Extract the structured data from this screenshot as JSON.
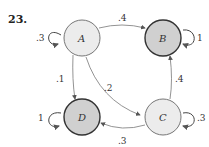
{
  "problem_number": "23.",
  "colors": {
    "light_node": "#ececec",
    "dark_node": "#cfcfcf",
    "light_stroke": "#888888",
    "dark_stroke": "#333333",
    "edge": "#666666"
  },
  "nodes": [
    {
      "id": "A",
      "label": "A",
      "absorbing": false
    },
    {
      "id": "B",
      "label": "B",
      "absorbing": true
    },
    {
      "id": "C",
      "label": "C",
      "absorbing": false
    },
    {
      "id": "D",
      "label": "D",
      "absorbing": true
    }
  ],
  "edges": [
    {
      "from": "A",
      "to": "A",
      "label": ".3"
    },
    {
      "from": "A",
      "to": "B",
      "label": ".4"
    },
    {
      "from": "A",
      "to": "D",
      "label": ".1"
    },
    {
      "from": "A",
      "to": "C",
      "label": ".2"
    },
    {
      "from": "B",
      "to": "B",
      "label": "1"
    },
    {
      "from": "C",
      "to": "B",
      "label": ".4"
    },
    {
      "from": "C",
      "to": "C",
      "label": ".3"
    },
    {
      "from": "C",
      "to": "D",
      "label": ".3"
    },
    {
      "from": "D",
      "to": "D",
      "label": "1"
    }
  ]
}
